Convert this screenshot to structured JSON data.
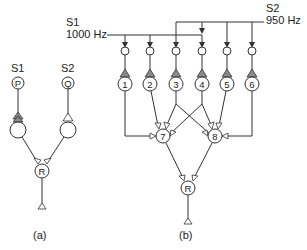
{
  "diagram_a": {
    "caption": "(a)",
    "source_labels": [
      "S1",
      "S2"
    ],
    "input_nodes": [
      "P",
      "Q"
    ],
    "output_node": "R"
  },
  "diagram_b": {
    "caption": "(b)",
    "s1": {
      "label": "S1",
      "freq": "1000 Hz"
    },
    "s2": {
      "label": "S2",
      "freq": "950 Hz"
    },
    "input_nodes": [
      "1",
      "2",
      "3",
      "4",
      "5",
      "6"
    ],
    "hidden_nodes": [
      "7",
      "8"
    ],
    "output_node": "R"
  }
}
